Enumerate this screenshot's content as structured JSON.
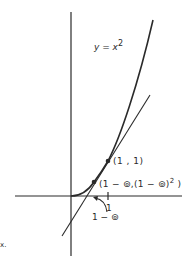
{
  "diagram": {
    "type": "function-graph-with-tangent",
    "function": "y = x^2",
    "curve_label": {
      "lhs": "y = x",
      "exponent": "2"
    },
    "points": [
      {
        "label": "(1 , 1)",
        "x": 1,
        "y": 1
      },
      {
        "label_main": "(1 − ⊚,(1 − ⊚)",
        "label_exp": "2",
        "label_end": " )",
        "x": "1-⊚",
        "y": "(1-⊚)^2"
      }
    ],
    "axis_tick_labels": {
      "one": "1",
      "one_minus_eps": "1 − ⊚"
    },
    "edge_text": "x.",
    "colors": {
      "ink": "#2a2a2a",
      "background": "#ffffff"
    }
  }
}
